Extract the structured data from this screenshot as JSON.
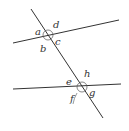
{
  "diagram": {
    "colors": {
      "line": "#333333",
      "arc": "#555555",
      "label": "#333333",
      "background": "#ffffff"
    },
    "upper_intersection": {
      "labels": {
        "a": "a",
        "b": "b",
        "c": "c",
        "d": "d"
      }
    },
    "lower_intersection": {
      "labels": {
        "e": "e",
        "f": "f",
        "g": "g",
        "h": "h"
      }
    }
  }
}
